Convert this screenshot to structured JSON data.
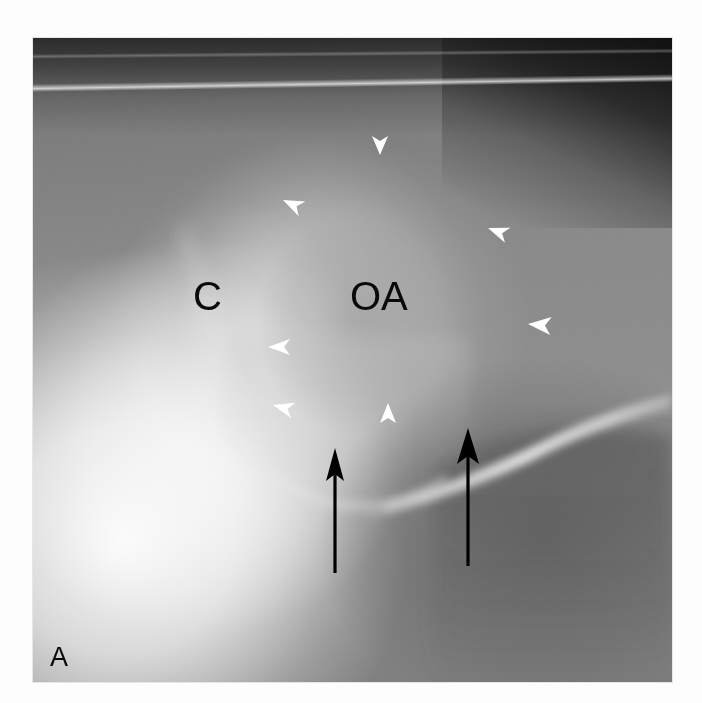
{
  "figure": {
    "panel_label": "A",
    "modality": "radiograph",
    "plate": {
      "x": 33,
      "y": 38,
      "width": 639,
      "height": 644,
      "background_color": "#8b8b8b",
      "page_background": "#ffffff"
    }
  },
  "labels": [
    {
      "id": "label-c",
      "text": "C",
      "meaning": "condyle",
      "color": "#0a0a0a",
      "font_size": 40,
      "x": 160,
      "y": 272
    },
    {
      "id": "label-oa",
      "text": "OA",
      "meaning": "osteoarthritis",
      "color": "#0a0a0a",
      "font_size": 40,
      "x": 317,
      "y": 272
    },
    {
      "id": "label-panel",
      "text": "A",
      "meaning": "panel-letter",
      "color": "#1a1a1a",
      "font_size": 27,
      "x": 17,
      "y": 628
    }
  ],
  "arrowheads": {
    "color": "#ffffff",
    "count": 7,
    "description": "white arrowheads outlining margin of lesion",
    "items": [
      {
        "id": "arrowhead-top",
        "x": 347,
        "y": 117,
        "rotation": 90,
        "size": 15
      },
      {
        "id": "arrowhead-upper-left",
        "x": 250,
        "y": 162,
        "rotation": 205,
        "size": 15
      },
      {
        "id": "arrowhead-upper-right",
        "x": 455,
        "y": 190,
        "rotation": 200,
        "size": 15
      },
      {
        "id": "arrowhead-mid-right",
        "x": 495,
        "y": 286,
        "rotation": 185,
        "size": 16
      },
      {
        "id": "arrowhead-mid-left",
        "x": 235,
        "y": 309,
        "rotation": 180,
        "size": 15
      },
      {
        "id": "arrowhead-lower-left",
        "x": 240,
        "y": 367,
        "rotation": 195,
        "size": 15
      },
      {
        "id": "arrowhead-bottom",
        "x": 355,
        "y": 365,
        "rotation": 270,
        "size": 15
      }
    ]
  },
  "arrows": {
    "color": "#000000",
    "count": 2,
    "description": "black arrows indicating cortical surface",
    "items": [
      {
        "id": "arrow-left",
        "tip_x": 302,
        "tip_y": 412,
        "tail_x": 302,
        "tail_y": 535
      },
      {
        "id": "arrow-right",
        "tip_x": 435,
        "tip_y": 392,
        "tail_x": 435,
        "tail_y": 528
      }
    ]
  },
  "anatomy_regions": [
    {
      "id": "region-condyle-head",
      "name": "condylar head"
    },
    {
      "id": "region-bright-ramus",
      "name": "dense bone / ramus"
    },
    {
      "id": "region-cortical-ridge",
      "name": "cortical ridge"
    },
    {
      "id": "region-upper-dark",
      "name": "soft tissue / air band"
    },
    {
      "id": "region-lesion",
      "name": "osteoarthritic lesion zone"
    }
  ]
}
